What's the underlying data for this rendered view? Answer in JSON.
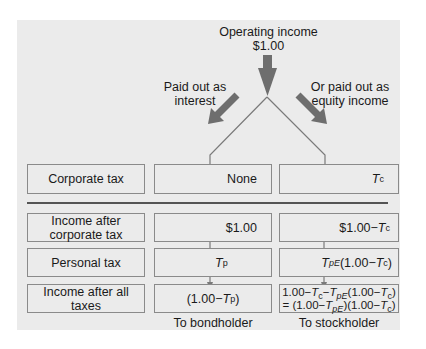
{
  "diagram": {
    "top": {
      "line1": "Operating income",
      "line2": "$1.00"
    },
    "branch_left": {
      "line1": "Paid out as",
      "line2": "interest"
    },
    "branch_right": {
      "line1": "Or paid out as",
      "line2": "equity income"
    },
    "rows": [
      {
        "label": "Corporate tax",
        "bond": "None",
        "stock_T": "T",
        "stock_sub": "c"
      },
      {
        "label_line1": "Income after",
        "label_line2": "corporate tax",
        "bond": "$1.00",
        "stock_prefix": "$1.00−",
        "stock_T": "T",
        "stock_sub": "c"
      },
      {
        "label": "Personal tax",
        "bond_T": "T",
        "bond_sub": "p",
        "stock_T": "T",
        "stock_sub": "pE",
        "stock_mid": "(1.00−",
        "stock_T2": "T",
        "stock_sub2": "c",
        "stock_end": ")"
      },
      {
        "label": "Income after all taxes",
        "bond_prefix": "(1.00−",
        "bond_T": "T",
        "bond_sub": "p",
        "bond_end": ")",
        "stock_l1_a": "1.00−",
        "stock_l1_T1": "T",
        "stock_l1_s1": "c",
        "stock_l1_b": "−",
        "stock_l1_T2": "T",
        "stock_l1_s2": "pE",
        "stock_l1_c": "(1.00−",
        "stock_l1_T3": "T",
        "stock_l1_s3": "c",
        "stock_l1_d": ")",
        "stock_l2_a": "= (1.00−",
        "stock_l2_T1": "T",
        "stock_l2_s1": "pE",
        "stock_l2_b": ")(1.00−",
        "stock_l2_T2": "T",
        "stock_l2_s2": "c",
        "stock_l2_c": ")"
      }
    ],
    "footer": {
      "bond": "To bondholder",
      "stock": "To stockholder"
    },
    "colors": {
      "panel": "#ebebeb",
      "arrow": "#6e6e6e",
      "line": "#7a7a7a",
      "divider": "#222222"
    }
  }
}
